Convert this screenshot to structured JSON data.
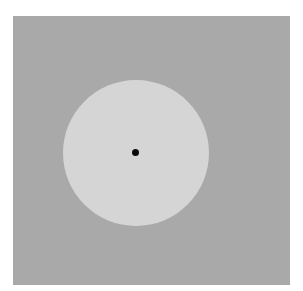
{
  "figure": {
    "colors": {
      "background": "#ffffff",
      "panel": "#a9a9a9",
      "disc": "#d5d5d5",
      "dot": "#0a0a0a"
    }
  }
}
